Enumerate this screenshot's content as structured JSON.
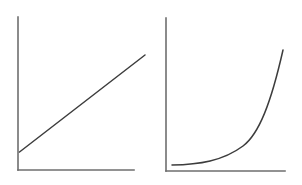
{
  "figure": {
    "background_color": "#ffffff",
    "axis_color": "#6e6e6e",
    "curve_color": "#3d3d3d",
    "panel_count": 2
  },
  "chart_data": [
    {
      "type": "line",
      "title": "",
      "subtitle": "",
      "xlabel": "",
      "ylabel": "",
      "legend": [],
      "annotations": [],
      "grid": false,
      "axes": {
        "style": "L-shaped spine, left and bottom only",
        "ticks": false,
        "tick_labels": false,
        "xlim": [
          0,
          1
        ],
        "ylim": [
          0,
          1
        ]
      },
      "series": [
        {
          "name": "linear growth",
          "x": [
            0.02,
            0.14,
            0.26,
            0.38,
            0.5,
            0.62,
            0.74,
            0.86,
            0.98,
            1.08
          ],
          "y": [
            0.12,
            0.2,
            0.28,
            0.36,
            0.44,
            0.52,
            0.6,
            0.68,
            0.76,
            0.82
          ]
        }
      ]
    },
    {
      "type": "line",
      "title": "",
      "subtitle": "",
      "xlabel": "",
      "ylabel": "",
      "legend": [],
      "annotations": [],
      "grid": false,
      "axes": {
        "style": "L-shaped spine, left and bottom only",
        "ticks": false,
        "tick_labels": false,
        "xlim": [
          0,
          1
        ],
        "ylim": [
          0,
          1
        ]
      },
      "series": [
        {
          "name": "exponential growth",
          "x": [
            0.05,
            0.15,
            0.25,
            0.35,
            0.45,
            0.55,
            0.65,
            0.75,
            0.85,
            0.95,
            1.0
          ],
          "y": [
            0.04,
            0.043,
            0.05,
            0.065,
            0.09,
            0.14,
            0.23,
            0.37,
            0.56,
            0.78,
            0.88
          ]
        }
      ]
    }
  ],
  "geometry": {
    "linear_panel": {
      "y_axis": "M18,17 L18,170",
      "x_axis": "M18,170 L134,170",
      "data_path": "M19.5,152 L145,55"
    },
    "exponential_panel": {
      "y_axis": "M15,18 L15,171",
      "x_axis": "M15,171 L134,171",
      "data_path": "M21,165 C48,164.5 72,161 92,146 C108,134 120,103 132,50"
    }
  }
}
